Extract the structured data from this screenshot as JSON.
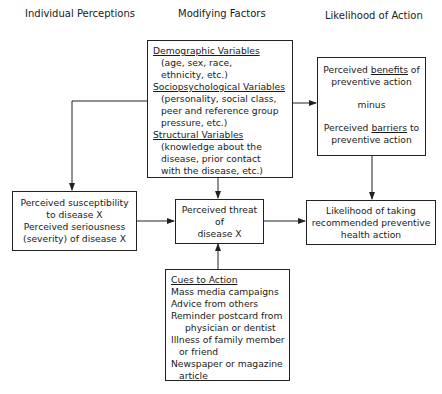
{
  "headers": {
    "individual": "Individual Perceptions",
    "modifying": "Modifying Factors",
    "likelihood": "Likelihood of Action"
  },
  "modifying_factors": {
    "demographic": {
      "title": "Demographic Variables",
      "lines": [
        "(age, sex, race,",
        "ethnicity, etc.)"
      ]
    },
    "sociopsychological": {
      "title": "Sociopsychological Variables",
      "lines": [
        "(personality, social class,",
        "peer and reference group",
        "pressure, etc.)"
      ]
    },
    "structural": {
      "title": "Structural Variables",
      "lines": [
        "(knowledge about the",
        "disease, prior contact",
        "with the disease, etc.)"
      ]
    }
  },
  "benefits_box": {
    "line1_pre": "Perceived ",
    "line1_u": "benefits",
    "line1_post": " of",
    "line2": "preventive action",
    "minus": "minus",
    "line3_pre": "Perceived ",
    "line3_u": "barriers",
    "line3_post": " to",
    "line4": "preventive action"
  },
  "susceptibility_box": {
    "lines": [
      "Perceived susceptibility",
      "to disease X",
      "Perceived seriousness",
      "(severity) of disease X"
    ]
  },
  "threat_box": {
    "lines": [
      "Perceived threat",
      "of",
      "disease X"
    ]
  },
  "likelihood_box": {
    "lines": [
      "Likelihood of taking",
      "recommended preventive",
      "health action"
    ]
  },
  "cues_box": {
    "title": "Cues to Action",
    "items": [
      "Mass media campaigns",
      "Advice from others",
      "Reminder postcard from",
      "physician or dentist",
      "Illness of family member",
      "or friend",
      "Newspaper or magazine",
      "article"
    ]
  },
  "colors": {
    "line": "#222222",
    "background": "#ffffff",
    "text": "#1a1a1a"
  }
}
